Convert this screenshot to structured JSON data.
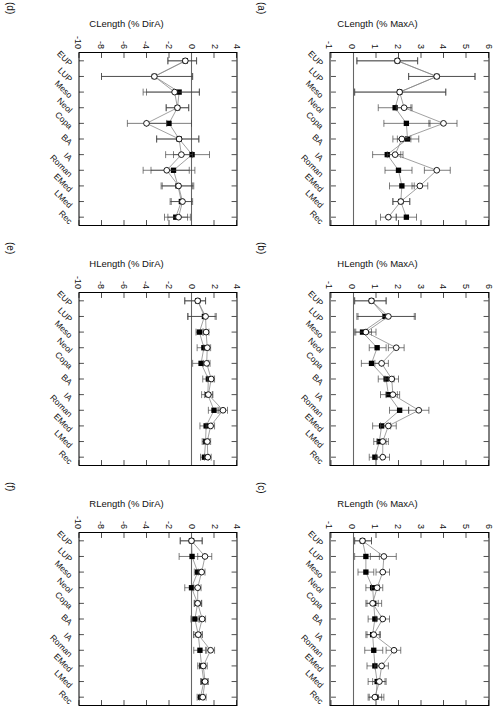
{
  "figure": {
    "categories": [
      "EUP",
      "LUP",
      "Meso",
      "Neol",
      "Copa",
      "BA",
      "IA",
      "Roman",
      "EMed",
      "LMed",
      "Rec"
    ],
    "series_names": [
      "filled-square-series",
      "open-circle-series"
    ],
    "panels": [
      {
        "id": "a",
        "label": "(a)",
        "ylabel": "CLength (% MaxA)",
        "yticks": [
          "6",
          "5",
          "4",
          "3",
          "2",
          "1",
          "0",
          "-1"
        ],
        "ylim": [
          -1,
          6
        ],
        "zero_line": 0
      },
      {
        "id": "b",
        "label": "(b)",
        "ylabel": "HLength (% MaxA)",
        "yticks": [
          "6",
          "5",
          "4",
          "3",
          "2",
          "1",
          "0",
          "-1"
        ],
        "ylim": [
          -1,
          6
        ],
        "zero_line": 0
      },
      {
        "id": "c",
        "label": "(c)",
        "ylabel": "RLength (% MaxA)",
        "yticks": [
          "6",
          "5",
          "4",
          "3",
          "2",
          "1",
          "0",
          "-1"
        ],
        "ylim": [
          -1,
          6
        ],
        "zero_line": 0
      },
      {
        "id": "d",
        "label": "(d)",
        "ylabel": "CLength (% DirA)",
        "yticks": [
          "4",
          "2",
          "0",
          "-2",
          "-4",
          "-6",
          "-8",
          "-10"
        ],
        "ylim": [
          -10,
          4
        ],
        "zero_line": 0
      },
      {
        "id": "e",
        "label": "(e)",
        "ylabel": "HLength (% DirA)",
        "yticks": [
          "4",
          "2",
          "0",
          "-2",
          "-4",
          "-6",
          "-8",
          "-10"
        ],
        "ylim": [
          -10,
          4
        ],
        "zero_line": 0
      },
      {
        "id": "f",
        "label": "(f)",
        "ylabel": "RLength (% DirA)",
        "yticks": [
          "4",
          "2",
          "0",
          "-2",
          "-4",
          "-6",
          "-8",
          "-10"
        ],
        "ylim": [
          -10,
          4
        ],
        "zero_line": 0
      }
    ]
  },
  "chart_data": [
    {
      "type": "line",
      "panel": "a",
      "title": "(a)",
      "ylabel": "CLength (% MaxA)",
      "xlabel": "",
      "ylim": [
        -1,
        6
      ],
      "grid": false,
      "legend": "none",
      "categories": [
        "EUP",
        "LUP",
        "Meso",
        "Neol",
        "Copa",
        "BA",
        "IA",
        "Roman",
        "EMed",
        "LMed",
        "Rec"
      ],
      "series": [
        {
          "name": "filled-square-series",
          "marker": "filled-square",
          "values": [
            1.95,
            3.7,
            2.05,
            1.85,
            2.35,
            2.4,
            1.5,
            2.0,
            2.15,
            2.1,
            2.35
          ],
          "err_low": [
            0.15,
            2.45,
            0.05,
            1.1,
            1.35,
            1.95,
            0.85,
            1.4,
            1.6,
            1.75,
            1.9
          ],
          "err_high": [
            2.85,
            5.4,
            4.1,
            2.55,
            3.4,
            2.9,
            2.1,
            2.6,
            2.7,
            2.5,
            2.8
          ]
        },
        {
          "name": "open-circle-series",
          "marker": "open-circle",
          "values": [
            1.95,
            3.7,
            2.05,
            2.25,
            4.0,
            2.15,
            1.85,
            3.7,
            2.95,
            2.1,
            1.55
          ],
          "err_low": [
            0.15,
            2.45,
            0.05,
            1.9,
            3.35,
            1.75,
            1.5,
            3.15,
            2.6,
            1.75,
            1.2
          ],
          "err_high": [
            2.85,
            5.4,
            4.1,
            2.6,
            4.6,
            2.55,
            2.2,
            4.3,
            3.3,
            2.5,
            1.9
          ]
        }
      ]
    },
    {
      "type": "line",
      "panel": "b",
      "title": "(b)",
      "ylabel": "HLength (% MaxA)",
      "xlabel": "",
      "ylim": [
        -1,
        6
      ],
      "grid": false,
      "legend": "none",
      "categories": [
        "EUP",
        "LUP",
        "Meso",
        "Neol",
        "Copa",
        "BA",
        "IA",
        "Roman",
        "EMed",
        "LMed",
        "Rec"
      ],
      "series": [
        {
          "name": "filled-square-series",
          "marker": "filled-square",
          "values": [
            0.8,
            1.4,
            0.4,
            1.05,
            0.8,
            1.45,
            1.55,
            2.05,
            1.25,
            1.15,
            0.95
          ],
          "err_low": [
            0.05,
            0.15,
            0.05,
            0.7,
            0.35,
            1.1,
            1.2,
            1.6,
            0.85,
            0.9,
            0.7
          ],
          "err_high": [
            1.45,
            2.7,
            0.8,
            1.45,
            1.25,
            1.8,
            1.95,
            2.45,
            1.65,
            1.45,
            1.25
          ]
        },
        {
          "name": "open-circle-series",
          "marker": "open-circle",
          "values": [
            0.8,
            1.55,
            0.55,
            1.9,
            1.25,
            1.7,
            1.75,
            2.9,
            1.55,
            1.3,
            1.3
          ],
          "err_low": [
            0.05,
            0.2,
            0.1,
            1.55,
            0.95,
            1.4,
            1.45,
            2.45,
            1.2,
            1.05,
            1.0
          ],
          "err_high": [
            1.45,
            2.75,
            1.0,
            2.25,
            1.55,
            2.0,
            2.05,
            3.35,
            1.9,
            1.55,
            1.6
          ]
        }
      ]
    },
    {
      "type": "line",
      "panel": "c",
      "title": "(c)",
      "ylabel": "RLength (% MaxA)",
      "xlabel": "",
      "ylim": [
        -1,
        6
      ],
      "grid": false,
      "legend": "none",
      "categories": [
        "EUP",
        "LUP",
        "Meso",
        "Neol",
        "Copa",
        "BA",
        "IA",
        "Roman",
        "EMed",
        "LMed",
        "Rec"
      ],
      "series": [
        {
          "name": "filled-square-series",
          "marker": "filled-square",
          "values": [
            0.4,
            0.55,
            0.55,
            0.85,
            0.9,
            0.95,
            0.85,
            0.9,
            0.95,
            1.05,
            1.0
          ],
          "err_low": [
            0.05,
            0.05,
            0.2,
            0.55,
            0.55,
            0.65,
            0.55,
            0.5,
            0.6,
            0.65,
            0.65
          ],
          "err_high": [
            0.8,
            1.15,
            0.9,
            1.15,
            1.25,
            1.25,
            1.15,
            1.3,
            1.3,
            1.4,
            1.35
          ]
        },
        {
          "name": "open-circle-series",
          "marker": "open-circle",
          "values": [
            0.4,
            1.35,
            1.3,
            1.05,
            0.85,
            1.3,
            0.9,
            1.8,
            1.25,
            1.15,
            0.95
          ],
          "err_low": [
            0.05,
            0.75,
            1.0,
            0.8,
            0.6,
            1.0,
            0.6,
            1.45,
            0.95,
            0.85,
            0.7
          ],
          "err_high": [
            0.8,
            1.9,
            1.6,
            1.3,
            1.1,
            1.6,
            1.2,
            2.1,
            1.55,
            1.45,
            1.25
          ]
        }
      ]
    },
    {
      "type": "line",
      "panel": "d",
      "title": "(d)",
      "ylabel": "CLength (% DirA)",
      "xlabel": "",
      "ylim": [
        -10,
        4
      ],
      "grid": false,
      "legend": "none",
      "categories": [
        "EUP",
        "LUP",
        "Meso",
        "Neol",
        "Copa",
        "BA",
        "IA",
        "Roman",
        "EMed",
        "LMed",
        "Rec"
      ],
      "series": [
        {
          "name": "filled-square-series",
          "marker": "filled-square",
          "values": [
            -0.55,
            -3.3,
            -1.1,
            -1.25,
            -2.0,
            -1.1,
            0.05,
            -1.6,
            -1.2,
            -0.9,
            -1.4
          ],
          "err_low": [
            -2.1,
            -8.0,
            -4.0,
            -2.25,
            -4.0,
            -3.1,
            -1.6,
            -3.6,
            -2.7,
            -1.9,
            -2.4
          ],
          "err_high": [
            0.45,
            0.1,
            0.7,
            -0.25,
            0.0,
            0.65,
            1.6,
            0.3,
            0.1,
            0.0,
            -0.35
          ]
        },
        {
          "name": "open-circle-series",
          "marker": "open-circle",
          "values": [
            -0.55,
            -3.3,
            -1.5,
            -1.25,
            -4.0,
            -1.1,
            -0.9,
            -2.2,
            -1.15,
            -0.8,
            -1.15
          ],
          "err_low": [
            -2.1,
            -8.0,
            -4.3,
            -2.25,
            -5.7,
            -3.1,
            -2.3,
            -4.3,
            -2.6,
            -1.8,
            -2.1
          ],
          "err_high": [
            0.45,
            0.1,
            0.7,
            -0.25,
            -2.2,
            0.65,
            0.1,
            -0.2,
            0.2,
            0.1,
            -0.1
          ]
        }
      ]
    },
    {
      "type": "line",
      "panel": "e",
      "title": "(e)",
      "ylabel": "HLength (% DirA)",
      "xlabel": "",
      "ylim": [
        -10,
        4
      ],
      "grid": false,
      "legend": "none",
      "categories": [
        "EUP",
        "LUP",
        "Meso",
        "Neol",
        "Copa",
        "BA",
        "IA",
        "Roman",
        "EMed",
        "LMed",
        "Rec"
      ],
      "series": [
        {
          "name": "filled-square-series",
          "marker": "filled-square",
          "values": [
            0.55,
            1.15,
            0.7,
            1.1,
            0.85,
            1.5,
            1.45,
            2.0,
            1.3,
            1.25,
            1.15
          ],
          "err_low": [
            -0.6,
            -0.35,
            0.4,
            0.5,
            0.1,
            1.0,
            0.9,
            1.5,
            0.75,
            0.95,
            0.8
          ],
          "err_high": [
            1.25,
            2.1,
            1.0,
            1.55,
            1.5,
            1.9,
            1.9,
            2.45,
            1.8,
            1.55,
            1.5
          ]
        },
        {
          "name": "open-circle-series",
          "marker": "open-circle",
          "values": [
            0.55,
            1.25,
            1.3,
            1.4,
            1.35,
            1.75,
            1.5,
            2.8,
            1.7,
            1.4,
            1.45
          ],
          "err_low": [
            -0.6,
            -0.3,
            1.05,
            1.1,
            1.05,
            1.4,
            1.15,
            2.35,
            1.3,
            1.1,
            1.15
          ],
          "err_high": [
            1.25,
            2.2,
            1.55,
            1.7,
            1.65,
            2.05,
            1.85,
            3.2,
            2.05,
            1.7,
            1.75
          ]
        }
      ]
    },
    {
      "type": "line",
      "panel": "f",
      "title": "(f)",
      "ylabel": "RLength (% DirA)",
      "xlabel": "",
      "ylim": [
        -10,
        4
      ],
      "grid": false,
      "legend": "none",
      "categories": [
        "EUP",
        "LUP",
        "Meso",
        "Neol",
        "Copa",
        "BA",
        "IA",
        "Roman",
        "EMed",
        "LMed",
        "Rec"
      ],
      "series": [
        {
          "name": "filled-square-series",
          "marker": "filled-square",
          "values": [
            0.0,
            0.05,
            0.55,
            0.0,
            0.55,
            0.3,
            0.6,
            0.75,
            0.9,
            1.1,
            0.8
          ],
          "err_low": [
            -1.0,
            -1.1,
            0.25,
            -0.6,
            0.25,
            -0.05,
            0.2,
            0.2,
            0.55,
            0.8,
            0.5
          ],
          "err_high": [
            0.95,
            1.15,
            0.85,
            0.6,
            0.9,
            0.7,
            0.95,
            1.25,
            1.25,
            1.4,
            1.1
          ]
        },
        {
          "name": "open-circle-series",
          "marker": "open-circle",
          "values": [
            0.0,
            1.2,
            0.9,
            0.55,
            0.55,
            0.95,
            0.6,
            1.7,
            1.05,
            1.2,
            1.0
          ],
          "err_low": [
            -1.0,
            0.55,
            0.6,
            0.2,
            0.25,
            0.65,
            0.2,
            1.35,
            0.7,
            0.9,
            0.7
          ],
          "err_high": [
            0.95,
            1.8,
            1.2,
            0.85,
            0.9,
            1.25,
            0.95,
            2.05,
            1.4,
            1.5,
            1.3
          ]
        }
      ]
    }
  ],
  "style": {
    "marker_filled_color": "#000000",
    "marker_open_fill": "#ffffff",
    "line_color": "#888888",
    "axis_color": "#000000",
    "text_color": "#111111"
  }
}
